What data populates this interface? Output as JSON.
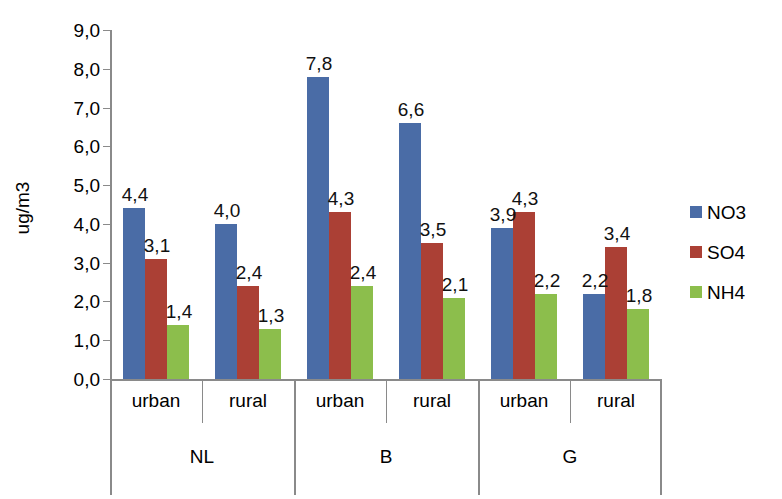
{
  "chart_data": {
    "type": "bar",
    "title": "",
    "subtitle": "",
    "xlabel": "",
    "ylabel": "ug/m3",
    "ylim": [
      0,
      9
    ],
    "ytick_step": 1,
    "grid": false,
    "decimal_separator": ",",
    "legend_position": "right",
    "categories": [
      "urban",
      "rural",
      "urban",
      "rural",
      "urban",
      "rural"
    ],
    "groups": [
      {
        "name": "NL",
        "categories": [
          "urban",
          "rural"
        ]
      },
      {
        "name": "B",
        "categories": [
          "urban",
          "rural"
        ]
      },
      {
        "name": "G",
        "categories": [
          "urban",
          "rural"
        ]
      }
    ],
    "ytick_labels": [
      "9,0",
      "8,0",
      "7,0",
      "6,0",
      "5,0",
      "4,0",
      "3,0",
      "2,0",
      "1,0",
      "0,0"
    ],
    "ytick_values": [
      9,
      8,
      7,
      6,
      5,
      4,
      3,
      2,
      1,
      0
    ],
    "series": [
      {
        "name": "NO3",
        "color": "#4a6ca6",
        "values": [
          4.4,
          4.0,
          7.8,
          6.6,
          3.9,
          2.2
        ],
        "labels": [
          "4,4",
          "4,0",
          "7,8",
          "6,6",
          "3,9",
          "2,2"
        ]
      },
      {
        "name": "SO4",
        "color": "#ab4035",
        "values": [
          3.1,
          2.4,
          4.3,
          3.5,
          4.3,
          3.4
        ],
        "labels": [
          "3,1",
          "2,4",
          "4,3",
          "3,5",
          "4,3",
          "3,4"
        ]
      },
      {
        "name": "NH4",
        "color": "#8cbe4c",
        "values": [
          1.4,
          1.3,
          2.4,
          2.1,
          2.2,
          1.8
        ],
        "labels": [
          "1,4",
          "1,3",
          "2,4",
          "2,1",
          "2,2",
          "1,8"
        ]
      }
    ]
  },
  "legend": {
    "items": [
      {
        "label": "NO3",
        "color": "#4a6ca6"
      },
      {
        "label": "SO4",
        "color": "#ab4035"
      },
      {
        "label": "NH4",
        "color": "#8cbe4c"
      }
    ]
  },
  "axis": {
    "y_title": "ug/m3"
  }
}
